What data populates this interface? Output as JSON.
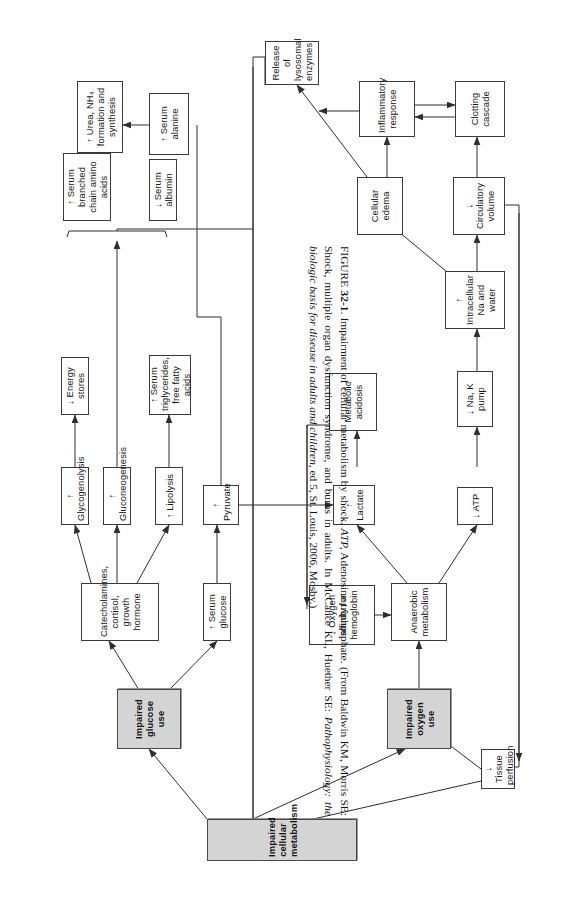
{
  "figure": {
    "number": "32-1",
    "label_prefix": "FIGURE",
    "title": "Impairment of cellular metabolism by shock.",
    "abbrev_term": "ATP,",
    "abbrev_def": "Adenosine triphosphate.",
    "source_part1": "(From Baldwin KM, Morris SE: Shock, multiple organ dysfunction syndrome, and burns in adults. In McCance KL, Huether SE:",
    "source_italic": "Pathophysiology: the biologic basis for disease in adults and children,",
    "source_part2": "ed 5, St. Louis, 2006, Mosby.)"
  },
  "diagram": {
    "type": "flowchart",
    "orientation": "rotated-90-ccw",
    "nodes": [
      {
        "id": "impaired-cellular-metabolism",
        "label": "Impaired cellular metabolism",
        "style": "shaded"
      },
      {
        "id": "impaired-glucose-use",
        "label": "Impaired glucose use",
        "style": "shaded"
      },
      {
        "id": "impaired-oxygen-use",
        "label": "Impaired oxygen use",
        "style": "shaded"
      },
      {
        "id": "catecholamines",
        "label": "Catecholamines, cortisol, growth hormone",
        "style": "plain"
      },
      {
        "id": "serum-glucose",
        "label": "↑ Serum glucose",
        "style": "plain"
      },
      {
        "id": "glycogenolysis",
        "label": "↑ Glycogenolysis",
        "style": "plain"
      },
      {
        "id": "energy-stores",
        "label": "↓ Energy stores",
        "style": "plain"
      },
      {
        "id": "gluconeogenesis",
        "label": "↑ Gluconeogenesis",
        "style": "plain"
      },
      {
        "id": "lipolysis",
        "label": "↑ Lipolysis",
        "style": "plain"
      },
      {
        "id": "serum-triglycerides",
        "label": "↑ Serum triglycerides, free fatty acids",
        "style": "plain"
      },
      {
        "id": "pyruvate",
        "label": "↑ Pyruvate",
        "style": "plain"
      },
      {
        "id": "serum-branched-chain",
        "label": "↑ Serum branched chain amino acids",
        "style": "plain"
      },
      {
        "id": "urea-nh4",
        "label": "↑ Urea, NH₄ formation and synthesis",
        "style": "plain"
      },
      {
        "id": "serum-albumin",
        "label": "↓ Serum albumin",
        "style": "plain"
      },
      {
        "id": "serum-alanine",
        "label": "↑ Serum alanine",
        "style": "plain"
      },
      {
        "id": "oxygen-affinity",
        "label": "↓ Oxygen affinity for hemoglobin",
        "style": "plain"
      },
      {
        "id": "anaerobic-metabolism",
        "label": "Anaerobic metabolism",
        "style": "plain"
      },
      {
        "id": "lactate",
        "label": "↑ Lactate",
        "style": "plain"
      },
      {
        "id": "metabolic-acidosis",
        "label": "Metabolic acidosis",
        "style": "plain"
      },
      {
        "id": "atp",
        "label": "↓ ATP",
        "style": "plain"
      },
      {
        "id": "na-k-pump",
        "label": "↓ Na, K pump",
        "style": "plain"
      },
      {
        "id": "intracellular-na",
        "label": "↑ Intracellular Na and water",
        "style": "plain"
      },
      {
        "id": "circulatory-volume",
        "label": "↓ Circulatory volume",
        "style": "plain"
      },
      {
        "id": "cellular-edema",
        "label": "Cellular edema",
        "style": "plain"
      },
      {
        "id": "clotting-cascade",
        "label": "Clotting cascade",
        "style": "plain"
      },
      {
        "id": "inflammatory-response",
        "label": "Inflammatory response",
        "style": "plain"
      },
      {
        "id": "release-lysosomal",
        "label": "Release of lysosomal enzymes",
        "style": "plain"
      },
      {
        "id": "tissue-perfusion",
        "label": "↓ Tissue perfusion",
        "style": "plain"
      }
    ],
    "edges": [
      {
        "from": "impaired-cellular-metabolism",
        "to": "impaired-glucose-use"
      },
      {
        "from": "impaired-cellular-metabolism",
        "to": "impaired-oxygen-use"
      },
      {
        "from": "impaired-glucose-use",
        "to": "catecholamines"
      },
      {
        "from": "impaired-glucose-use",
        "to": "serum-glucose"
      },
      {
        "from": "catecholamines",
        "to": "glycogenolysis"
      },
      {
        "from": "catecholamines",
        "to": "gluconeogenesis"
      },
      {
        "from": "catecholamines",
        "to": "lipolysis"
      },
      {
        "from": "glycogenolysis",
        "to": "energy-stores"
      },
      {
        "from": "lipolysis",
        "to": "serum-triglycerides"
      },
      {
        "from": "serum-glucose",
        "to": "pyruvate"
      },
      {
        "from": "gluconeogenesis",
        "to": "serum-branched-chain"
      },
      {
        "from": "gluconeogenesis",
        "to": "serum-albumin"
      },
      {
        "from": "serum-alanine",
        "to": "pyruvate"
      },
      {
        "from": "serum-alanine",
        "to": "urea-nh4"
      },
      {
        "from": "impaired-oxygen-use",
        "to": "anaerobic-metabolism"
      },
      {
        "from": "oxygen-affinity",
        "to": "anaerobic-metabolism"
      },
      {
        "from": "anaerobic-metabolism",
        "to": "lactate"
      },
      {
        "from": "anaerobic-metabolism",
        "to": "atp"
      },
      {
        "from": "lactate",
        "to": "metabolic-acidosis"
      },
      {
        "from": "metabolic-acidosis",
        "to": "oxygen-affinity"
      },
      {
        "from": "pyruvate",
        "to": "lactate"
      },
      {
        "from": "atp",
        "to": "na-k-pump"
      },
      {
        "from": "na-k-pump",
        "to": "intracellular-na"
      },
      {
        "from": "intracellular-na",
        "to": "circulatory-volume"
      },
      {
        "from": "intracellular-na",
        "to": "cellular-edema"
      },
      {
        "from": "circulatory-volume",
        "to": "clotting-cascade"
      },
      {
        "from": "circulatory-volume",
        "to": "tissue-perfusion"
      },
      {
        "from": "cellular-edema",
        "to": "inflammatory-response"
      },
      {
        "from": "cellular-edema",
        "to": "release-lysosomal"
      },
      {
        "from": "clotting-cascade",
        "to": "inflammatory-response"
      },
      {
        "from": "inflammatory-response",
        "to": "clotting-cascade"
      },
      {
        "from": "inflammatory-response",
        "to": "release-lysosomal"
      },
      {
        "from": "release-lysosomal",
        "to": "impaired-cellular-metabolism"
      },
      {
        "from": "tissue-perfusion",
        "to": "impaired-cellular-metabolism"
      },
      {
        "from": "tissue-perfusion",
        "to": "impaired-oxygen-use"
      }
    ]
  }
}
